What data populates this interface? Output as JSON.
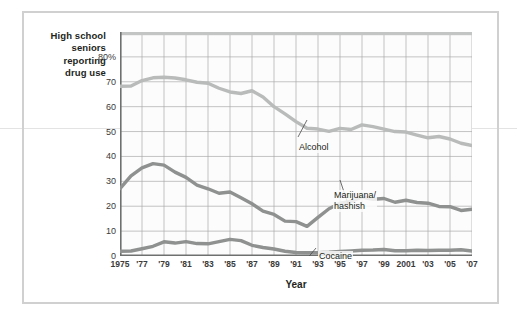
{
  "figure": {
    "y_axis_caption": [
      "High school",
      "seniors",
      "reporting",
      "drug use"
    ],
    "x_axis_title": "Year"
  },
  "chart_data": {
    "type": "line",
    "title": "",
    "xlabel": "Year",
    "ylabel": "High school seniors reporting drug use",
    "ylim": [
      0,
      90
    ],
    "xlim": [
      1975,
      2007
    ],
    "grid": true,
    "legend": "annotations-on-plot",
    "ytick_labels": [
      "0",
      "10",
      "20",
      "30",
      "40",
      "50",
      "60",
      "70",
      "80%"
    ],
    "ytick_values": [
      0,
      10,
      20,
      30,
      40,
      50,
      60,
      70,
      80
    ],
    "xtick_labels": [
      "1975",
      "'77",
      "'79",
      "'81",
      "'83",
      "'85",
      "'87",
      "'89",
      "'91",
      "'93",
      "'95",
      "'97",
      "'99",
      "2001",
      "'03",
      "'05",
      "'07"
    ],
    "xtick_values": [
      1975,
      1977,
      1979,
      1981,
      1983,
      1985,
      1987,
      1989,
      1991,
      1993,
      1995,
      1997,
      1999,
      2001,
      2003,
      2005,
      2007
    ],
    "x": [
      1975,
      1976,
      1977,
      1978,
      1979,
      1980,
      1981,
      1982,
      1983,
      1984,
      1985,
      1986,
      1987,
      1988,
      1989,
      1990,
      1991,
      1992,
      1993,
      1994,
      1995,
      1996,
      1997,
      1998,
      1999,
      2000,
      2001,
      2002,
      2003,
      2004,
      2005,
      2006,
      2007
    ],
    "series": [
      {
        "name": "Alcohol",
        "color": "#b9bbba",
        "values": [
          68.2,
          68.3,
          70.5,
          71.6,
          71.8,
          71.5,
          70.8,
          69.8,
          69.4,
          67.4,
          65.9,
          65.3,
          66.4,
          63.9,
          60.0,
          57.1,
          54.0,
          51.3,
          51.0,
          50.1,
          51.3,
          50.8,
          52.7,
          52.0,
          51.0,
          50.0,
          49.8,
          48.6,
          47.5,
          48.0,
          47.0,
          45.3,
          44.4
        ]
      },
      {
        "name": "Marijuana/\nhashish",
        "label_lines": [
          "Marijuana/",
          "hashish"
        ],
        "color": "#8e9190",
        "values": [
          27.1,
          32.2,
          35.4,
          37.1,
          36.5,
          33.7,
          31.6,
          28.5,
          27.0,
          25.2,
          25.7,
          23.4,
          21.0,
          18.0,
          16.7,
          14.0,
          13.8,
          11.9,
          15.5,
          19.0,
          21.2,
          21.9,
          23.7,
          22.8,
          23.1,
          21.6,
          22.4,
          21.5,
          21.2,
          19.9,
          19.8,
          18.3,
          18.8
        ]
      },
      {
        "name": "Cocaine",
        "color": "#8e9190",
        "values": [
          1.9,
          2.0,
          2.9,
          3.9,
          5.7,
          5.2,
          5.8,
          5.0,
          4.9,
          5.8,
          6.7,
          6.2,
          4.3,
          3.4,
          2.8,
          1.9,
          1.4,
          1.3,
          1.3,
          1.5,
          1.8,
          2.0,
          2.3,
          2.4,
          2.6,
          2.1,
          2.1,
          2.3,
          2.2,
          2.3,
          2.3,
          2.5,
          2.0
        ]
      }
    ],
    "annotations": [
      {
        "series": "Alcohol",
        "text": "Alcohol"
      },
      {
        "series": "Marijuana/hashish",
        "text": "Marijuana/ hashish"
      },
      {
        "series": "Cocaine",
        "text": "Cocaine"
      }
    ]
  }
}
